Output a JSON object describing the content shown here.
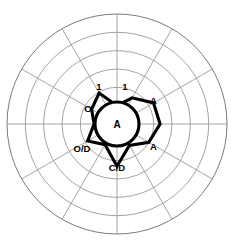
{
  "chart_data": {
    "type": "line",
    "chart_subtype": "radar-polar",
    "title": "",
    "subtitle": "",
    "xlabel": "",
    "ylabel": "",
    "grid": true,
    "legend_position": "none",
    "center": {
      "x": 117,
      "y": 124
    },
    "outer_radius": 110,
    "ring_count": 6,
    "ring_radii": [
      18.3,
      36.7,
      55.0,
      73.3,
      91.7,
      110.0
    ],
    "spoke_count": 12,
    "spoke_angles_deg": [
      0,
      30,
      60,
      90,
      120,
      150,
      180,
      210,
      240,
      270,
      300,
      330
    ],
    "rlim": [
      0,
      6
    ],
    "categories": [
      "spoke-0-right",
      "spoke-1",
      "spoke-2",
      "spoke-3-top",
      "spoke-4",
      "spoke-5",
      "spoke-6-left",
      "spoke-7",
      "spoke-8",
      "spoke-9-bottom",
      "spoke-10",
      "spoke-11"
    ],
    "series": [
      {
        "name": "trace",
        "values": [
          2.35,
          2.3,
          1.65,
          1.0,
          1.95,
          1.6,
          1.25,
          1.85,
          1.3,
          2.3,
          1.35,
          2.0
        ]
      }
    ],
    "center_marker": {
      "shape": "circle",
      "radius": 22,
      "label": "A"
    },
    "annotations": [
      {
        "text": "1",
        "x": 99,
        "y": 90,
        "anchor": "middle",
        "angle_deg": 108,
        "r": 2.0
      },
      {
        "text": "1",
        "x": 125,
        "y": 90,
        "anchor": "middle",
        "angle_deg": 72,
        "r": 2.0
      },
      {
        "text": "A",
        "x": 150,
        "y": 104,
        "anchor": "start",
        "angle_deg": 30,
        "r": 2.35
      },
      {
        "text": "A",
        "x": 150,
        "y": 150,
        "anchor": "start",
        "angle_deg": 330,
        "r": 2.3
      },
      {
        "text": "C/D",
        "x": 117,
        "y": 171,
        "anchor": "middle",
        "angle_deg": 270,
        "r": 2.3
      },
      {
        "text": "O/D",
        "x": 82,
        "y": 152,
        "anchor": "middle",
        "angle_deg": 210,
        "r": 1.85
      },
      {
        "text": "O",
        "x": 88,
        "y": 112,
        "anchor": "middle",
        "angle_deg": 150,
        "r": 1.6
      },
      {
        "text": "A",
        "x": 117,
        "y": 128,
        "anchor": "middle",
        "angle_deg": 0,
        "r": 0
      }
    ],
    "colors": {
      "background": "#ffffff",
      "grid": "#8d8d8d",
      "series": "#000000",
      "label": "#000000"
    }
  }
}
